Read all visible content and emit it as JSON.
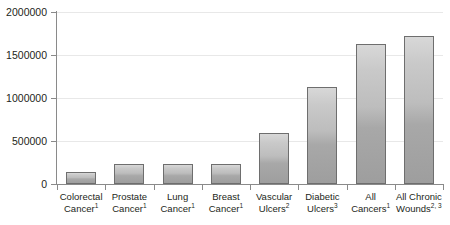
{
  "chart_data": {
    "type": "bar",
    "title": "",
    "subtitle": "",
    "xlabel": "",
    "ylabel": "",
    "ylim": [
      0,
      2000000
    ],
    "ytick_labels": [
      "0",
      "500000",
      "1000000",
      "1500000",
      "2000000"
    ],
    "ytick_values": [
      0,
      500000,
      1000000,
      1500000,
      2000000
    ],
    "grid": "horizontal",
    "legend": "none",
    "categories": [
      "Colorectal Cancer",
      "Prostate Cancer",
      "Lung Cancer",
      "Breast Cancer",
      "Vascular Ulcers",
      "Diabetic Ulcers",
      "All Cancers",
      "All Chronic Wounds"
    ],
    "category_footnotes": [
      "1",
      "1",
      "1",
      "1",
      "2",
      "3",
      "1",
      "2, 3"
    ],
    "values": [
      140000,
      230000,
      230000,
      235000,
      590000,
      1130000,
      1630000,
      1720000
    ],
    "bar_color": "#bdbdbd",
    "bar_border_color": "#6e6e6e",
    "grid_color": "#e8e8e8",
    "axis_color": "#8a8a8a",
    "text_color": "#231f20"
  },
  "axis": {
    "y_ticks": [
      {
        "label": "2000000",
        "value": 2000000
      },
      {
        "label": "1500000",
        "value": 1500000
      },
      {
        "label": "1000000",
        "value": 1000000
      },
      {
        "label": "500000",
        "value": 500000
      },
      {
        "label": "0",
        "value": 0
      }
    ]
  },
  "categories": [
    {
      "name": "Colorectal Cancer",
      "line1": "Colorectal",
      "line2": "Cancer",
      "sup": "1"
    },
    {
      "name": "Prostate Cancer",
      "line1": "Prostate",
      "line2": "Cancer",
      "sup": "1"
    },
    {
      "name": "Lung Cancer",
      "line1": "Lung Cancer",
      "line2": "",
      "sup": "1"
    },
    {
      "name": "Breast Cancer",
      "line1": "Breast",
      "line2": "Cancer",
      "sup": "1"
    },
    {
      "name": "Vascular Ulcers",
      "line1": "Vascular",
      "line2": "Ulcers",
      "sup": "2"
    },
    {
      "name": "Diabetic Ulcers",
      "line1": "Diabetic",
      "line2": "Ulcers",
      "sup": "3"
    },
    {
      "name": "All Cancers",
      "line1": "All Cancers",
      "line2": "",
      "sup": "1"
    },
    {
      "name": "All Chronic Wounds",
      "line1": "All Chronic",
      "line2": "Wounds",
      "sup": "2, 3"
    }
  ]
}
